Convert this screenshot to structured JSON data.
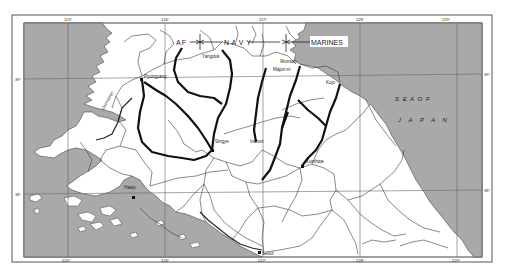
{
  "map": {
    "sea_color": "#a9a9a9",
    "land_color": "#ffffff",
    "line_color": "#333333",
    "route_color": "#111111",
    "zones": {
      "af": "AF",
      "navy": "N A V Y",
      "marines": "MARINES"
    },
    "sea_label": {
      "line1": "S E A   O F",
      "line2": "J A P A N"
    },
    "cities": {
      "pyongyang": "Pyongyang",
      "yangdok": "Yangdok",
      "wonsan": "Wonsan",
      "majon_ni": "Majon-ni",
      "kojo": "Kojo",
      "singye": "Singye",
      "inchon": "Inchon",
      "kumhwa": "Kumhwa",
      "haeju": "Haeju",
      "seoul": "Seoul",
      "chinnampo": "Chinnampo"
    },
    "longitude_ticks": {
      "top": [
        "125°",
        "126°",
        "127°",
        "128°",
        "129°"
      ],
      "bottom": [
        "125°",
        "126°",
        "127°",
        "128°",
        "129°"
      ]
    },
    "latitude_ticks": {
      "left": [
        "39°",
        "38°"
      ],
      "right": [
        "39°",
        "38°"
      ]
    }
  }
}
